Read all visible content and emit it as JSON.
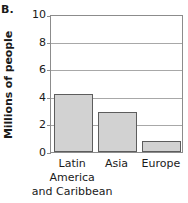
{
  "panel": {
    "letter": "B."
  },
  "chart_data": {
    "type": "bar",
    "title": "",
    "xlabel": "",
    "ylabel": "Millions of people",
    "categories": [
      "Latin America and Caribbean",
      "Asia",
      "Europe"
    ],
    "category_lines": [
      [
        "Latin",
        "America",
        "and Caribbean"
      ],
      [
        "Asia"
      ],
      [
        "Europe"
      ]
    ],
    "values": [
      4.2,
      2.9,
      0.8
    ],
    "ylim": [
      0,
      10
    ],
    "yticks": [
      0,
      2,
      4,
      6,
      8,
      10
    ],
    "ytick_labels": [
      "0",
      "2",
      "4",
      "6",
      "8",
      "10"
    ],
    "grid": true,
    "grid_axis": "y",
    "legend": false,
    "bar_fill": "#d2d2d2",
    "bar_edge": "#5d5d5d",
    "gridline_color": "#a8a8a8",
    "frame_color": "#8c8c8c"
  }
}
